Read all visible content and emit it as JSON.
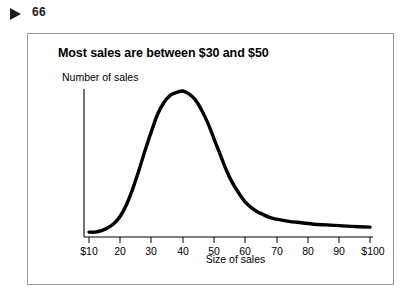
{
  "marker": {
    "icon": "play-triangle-icon",
    "page_number": "66"
  },
  "figure": {
    "title": "Most sales are between $30 and $50"
  },
  "chart_data": {
    "type": "line",
    "title": "Most sales are between $30 and $50",
    "xlabel": "Size of sales",
    "ylabel": "Number of sales",
    "xlim": [
      10,
      100
    ],
    "ylim": [
      0,
      100
    ],
    "grid": false,
    "legend": false,
    "axis_color": "#000000",
    "line_color": "#000000",
    "xticks": [
      "$10",
      "20",
      "30",
      "40",
      "50",
      "60",
      "70",
      "80",
      "90",
      "$100"
    ],
    "xtick_values": [
      10,
      20,
      30,
      40,
      50,
      60,
      70,
      80,
      90,
      100
    ],
    "yticks": [],
    "x": [
      10,
      12,
      14,
      16,
      18,
      20,
      22,
      24,
      26,
      28,
      30,
      32,
      34,
      36,
      38,
      40,
      42,
      44,
      46,
      48,
      50,
      52,
      54,
      56,
      58,
      60,
      62,
      64,
      66,
      68,
      70,
      74,
      78,
      82,
      86,
      90,
      94,
      100
    ],
    "values": [
      2,
      2,
      3,
      5,
      8,
      13,
      21,
      32,
      45,
      59,
      72,
      84,
      92,
      97,
      99,
      100,
      98,
      94,
      87,
      78,
      67,
      56,
      45,
      36,
      29,
      23,
      19,
      16,
      14,
      12,
      11,
      9.5,
      8.5,
      7.5,
      7,
      6.5,
      6,
      5.5
    ]
  }
}
